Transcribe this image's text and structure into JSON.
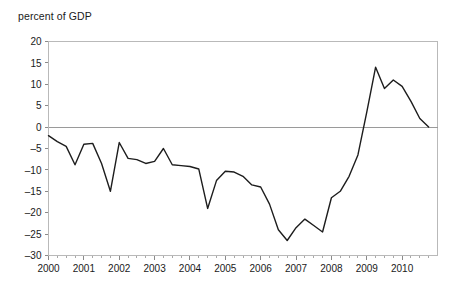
{
  "chart_data": {
    "type": "line",
    "title": "percent of GDP",
    "xlabel": "",
    "ylabel": "percent of GDP",
    "ylim": [
      -30,
      20
    ],
    "xlim": [
      2000,
      2011
    ],
    "ytick_step": 5,
    "grid": false,
    "legend": false,
    "legend_position": "none",
    "line_color": "#1d1d1d",
    "frame_color": "#b9b9b9",
    "zero_line_color": "#9a9a9a",
    "ytick_labels": [
      "20",
      "15",
      "10",
      "5",
      "0",
      "-5",
      "-10",
      "-15",
      "-20",
      "-25",
      "-30"
    ],
    "ytick_values": [
      20,
      15,
      10,
      5,
      0,
      -5,
      -10,
      -15,
      -20,
      -25,
      -30
    ],
    "xtick_labels": [
      "2000",
      "2001",
      "2002",
      "2003",
      "2004",
      "2005",
      "2006",
      "2007",
      "2008",
      "2009",
      "2010"
    ],
    "xtick_values": [
      2000,
      2001,
      2002,
      2003,
      2004,
      2005,
      2006,
      2007,
      2008,
      2009,
      2010
    ],
    "minor_ticks_per_year": 4,
    "series": [
      {
        "name": "percent of GDP",
        "x": [
          2000.0,
          2000.25,
          2000.5,
          2000.75,
          2001.0,
          2001.25,
          2001.5,
          2001.75,
          2002.0,
          2002.25,
          2002.5,
          2002.75,
          2003.0,
          2003.25,
          2003.5,
          2003.75,
          2004.0,
          2004.25,
          2004.5,
          2004.75,
          2005.0,
          2005.25,
          2005.5,
          2005.75,
          2006.0,
          2006.25,
          2006.5,
          2006.75,
          2007.0,
          2007.25,
          2007.5,
          2007.75,
          2008.0,
          2008.25,
          2008.5,
          2008.75,
          2009.0,
          2009.25,
          2009.5,
          2009.75,
          2010.0,
          2010.25,
          2010.5,
          2010.75
        ],
        "y": [
          -2.0,
          -3.4,
          -4.5,
          -8.8,
          -4.0,
          -3.8,
          -8.5,
          -15.0,
          -3.6,
          -7.3,
          -7.6,
          -8.5,
          -8.0,
          -5.0,
          -8.8,
          -9.0,
          -9.2,
          -9.8,
          -19.0,
          -12.5,
          -10.3,
          -10.5,
          -11.5,
          -13.5,
          -14.0,
          -18.0,
          -24.0,
          -26.5,
          -23.5,
          -21.5,
          -23.0,
          -24.5,
          -16.5,
          -15.0,
          -11.5,
          -6.5,
          3.5,
          14.0,
          9.0,
          11.0,
          9.5,
          6.0,
          2.0,
          0.0
        ]
      }
    ]
  }
}
